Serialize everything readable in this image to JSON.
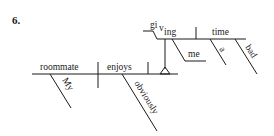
{
  "problem_number": "6.",
  "diagram": {
    "type": "Reed-Kellogg sentence diagram",
    "subject": "roommate",
    "subject_modifier": "My",
    "verb": "enjoys",
    "verb_modifier": "obviously",
    "object_phrase": {
      "verbal": {
        "stem": "gi",
        "sub": "v",
        "suffix": "ing"
      },
      "indirect_object": "me",
      "direct_object": "time",
      "modifiers": [
        "a",
        "bad"
      ]
    }
  }
}
